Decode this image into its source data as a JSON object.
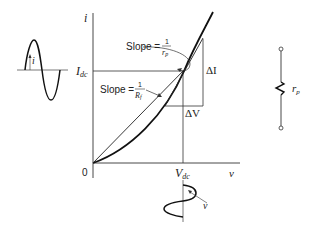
{
  "axes": {
    "y_label": "i",
    "x_label": "v",
    "origin_label": "0",
    "idc_label_main": "I",
    "idc_label_sub": "dc",
    "vdc_label_main": "V",
    "vdc_label_sub": "dc"
  },
  "annotations": {
    "slope_rp_prefix": "Slope =",
    "slope_rp_num": "1",
    "slope_rp_den_main": "r",
    "slope_rp_den_sub": "p",
    "slope_rf_prefix": "Slope =",
    "slope_rf_num": "1",
    "slope_rf_den_main": "R",
    "slope_rf_den_sub": "f",
    "delta_i": "ΔI",
    "delta_v": "ΔV"
  },
  "waveforms": {
    "current_label": "i",
    "voltage_label": "v"
  },
  "resistor": {
    "label_main": "r",
    "label_sub": "p"
  },
  "colors": {
    "line": "#1a1a1a",
    "thin": "#333333"
  }
}
